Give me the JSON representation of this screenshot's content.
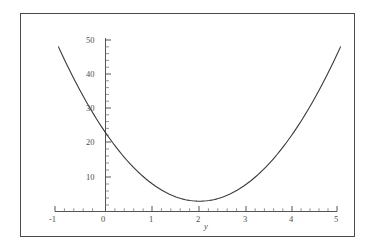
{
  "figure": {
    "background": "#ffffff",
    "frame_color": "#4a4a4a",
    "curve_color": "#3a3a3a",
    "axis_color": "#555555",
    "text_color": "#4d4d4d"
  },
  "chart_data": {
    "type": "line",
    "title": "",
    "subtitle": "",
    "xlabel": "y",
    "ylabel": "",
    "xlim": [
      -1,
      5
    ],
    "ylim": [
      0,
      53
    ],
    "grid": false,
    "legend": null,
    "axis_style": "cartesian-crossing-axes",
    "x_ticks_major": [
      -1,
      0,
      1,
      2,
      3,
      4,
      5
    ],
    "x_tick_labels": [
      "-1",
      "0",
      "1",
      "2",
      "3",
      "4",
      "5"
    ],
    "x_minor_tick_step": 0.2,
    "y_ticks_major": [
      10,
      20,
      30,
      40,
      50
    ],
    "y_tick_labels": [
      "10",
      "20",
      "30",
      "40",
      "50"
    ],
    "y_minor_tick_step": 2,
    "series": [
      {
        "name": "parabola",
        "equation": "5*(x-2)^2 + 3",
        "x": [
          -1.0,
          -0.8,
          -0.6,
          -0.4,
          -0.2,
          0.0,
          0.2,
          0.4,
          0.6,
          0.8,
          1.0,
          1.2,
          1.4,
          1.6,
          1.8,
          2.0,
          2.2,
          2.4,
          2.6,
          2.8,
          3.0,
          3.2,
          3.4,
          3.6,
          3.8,
          4.0,
          4.2,
          4.4,
          4.6,
          4.8,
          5.0
        ],
        "values": [
          48.0,
          42.2,
          36.8,
          31.8,
          27.2,
          23.0,
          19.2,
          15.8,
          12.8,
          10.2,
          8.0,
          6.2,
          4.8,
          3.8,
          3.2,
          3.0,
          3.2,
          3.8,
          4.8,
          6.2,
          8.0,
          10.2,
          12.8,
          15.8,
          19.2,
          23.0,
          27.2,
          31.8,
          36.8,
          42.2,
          48.0
        ]
      }
    ],
    "annotations": [
      {
        "text": "y",
        "role": "x-axis-label",
        "x": 2.35,
        "y": -3.5
      }
    ]
  },
  "labels": {
    "y_50": "50",
    "y_40": "40",
    "y_30": "30",
    "y_20": "20",
    "y_10": "10",
    "x_m1": "-1",
    "x_0": "0",
    "x_1": "1",
    "x_2": "2",
    "x_3": "3",
    "x_4": "4",
    "x_5": "5",
    "x_axis_name": "y"
  }
}
